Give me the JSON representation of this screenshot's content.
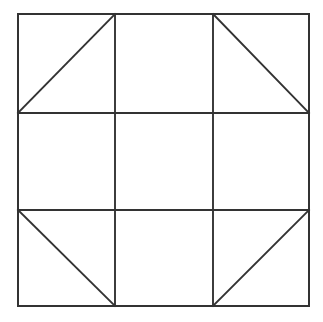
{
  "figure": {
    "shape_type": "geometric-line-diagram",
    "background_color": "#ffffff",
    "line_color": "#333333",
    "line_width": 1.9,
    "outer_square": {
      "name": "outer-square",
      "x": 18,
      "y": 14,
      "width": 291,
      "height": 292
    },
    "grid": {
      "rows": 3,
      "columns": 3,
      "cell_width": 97,
      "cell_height": 97.3,
      "vertical_line_x": [
        115,
        213
      ],
      "horizontal_line_y": [
        113,
        210
      ]
    },
    "cells": [
      {
        "id": "cell-top-left",
        "row": 0,
        "col": 0,
        "diagonal": "anti",
        "diagonal_label": "/",
        "x": 18,
        "y": 14,
        "width": 97,
        "height": 99
      },
      {
        "id": "cell-top-center",
        "row": 0,
        "col": 1,
        "diagonal": "none",
        "diagonal_label": "",
        "x": 115,
        "y": 14,
        "width": 98,
        "height": 99
      },
      {
        "id": "cell-top-right",
        "row": 0,
        "col": 2,
        "diagonal": "main",
        "diagonal_label": "\\",
        "x": 213,
        "y": 14,
        "width": 96,
        "height": 99
      },
      {
        "id": "cell-middle-left",
        "row": 1,
        "col": 0,
        "diagonal": "none",
        "diagonal_label": "",
        "x": 18,
        "y": 113,
        "width": 97,
        "height": 97
      },
      {
        "id": "cell-center",
        "row": 1,
        "col": 1,
        "diagonal": "none",
        "diagonal_label": "",
        "x": 115,
        "y": 113,
        "width": 98,
        "height": 97
      },
      {
        "id": "cell-middle-right",
        "row": 1,
        "col": 2,
        "diagonal": "none",
        "diagonal_label": "",
        "x": 213,
        "y": 113,
        "width": 96,
        "height": 97
      },
      {
        "id": "cell-bottom-left",
        "row": 2,
        "col": 0,
        "diagonal": "main",
        "diagonal_label": "\\",
        "x": 18,
        "y": 210,
        "width": 97,
        "height": 96
      },
      {
        "id": "cell-bottom-center",
        "row": 2,
        "col": 1,
        "diagonal": "none",
        "diagonal_label": "",
        "x": 115,
        "y": 210,
        "width": 98,
        "height": 96
      },
      {
        "id": "cell-bottom-right",
        "row": 2,
        "col": 2,
        "diagonal": "anti",
        "diagonal_label": "/",
        "x": 213,
        "y": 210,
        "width": 96,
        "height": 96
      }
    ],
    "diagonals": [
      {
        "id": "diagonal-top-left",
        "cell": "cell-top-left",
        "x1": 18,
        "y1": 113,
        "x2": 115,
        "y2": 14,
        "direction": "bottom-left-to-top-right"
      },
      {
        "id": "diagonal-top-right",
        "cell": "cell-top-right",
        "x1": 213,
        "y1": 14,
        "x2": 309,
        "y2": 113,
        "direction": "top-left-to-bottom-right"
      },
      {
        "id": "diagonal-bottom-left",
        "cell": "cell-bottom-left",
        "x1": 18,
        "y1": 210,
        "x2": 115,
        "y2": 306,
        "direction": "top-left-to-bottom-right"
      },
      {
        "id": "diagonal-bottom-right",
        "cell": "cell-bottom-right",
        "x1": 213,
        "y1": 306,
        "x2": 309,
        "y2": 210,
        "direction": "bottom-left-to-top-right"
      }
    ],
    "grid_lines": [
      {
        "id": "grid-line-vertical-1",
        "orientation": "vertical",
        "x1": 115,
        "y1": 14,
        "x2": 115,
        "y2": 306
      },
      {
        "id": "grid-line-vertical-2",
        "orientation": "vertical",
        "x1": 213,
        "y1": 14,
        "x2": 213,
        "y2": 306
      },
      {
        "id": "grid-line-horizontal-1",
        "orientation": "horizontal",
        "x1": 18,
        "y1": 113,
        "x2": 309,
        "y2": 113
      },
      {
        "id": "grid-line-horizontal-2",
        "orientation": "horizontal",
        "x1": 18,
        "y1": 210,
        "x2": 309,
        "y2": 210
      }
    ]
  }
}
